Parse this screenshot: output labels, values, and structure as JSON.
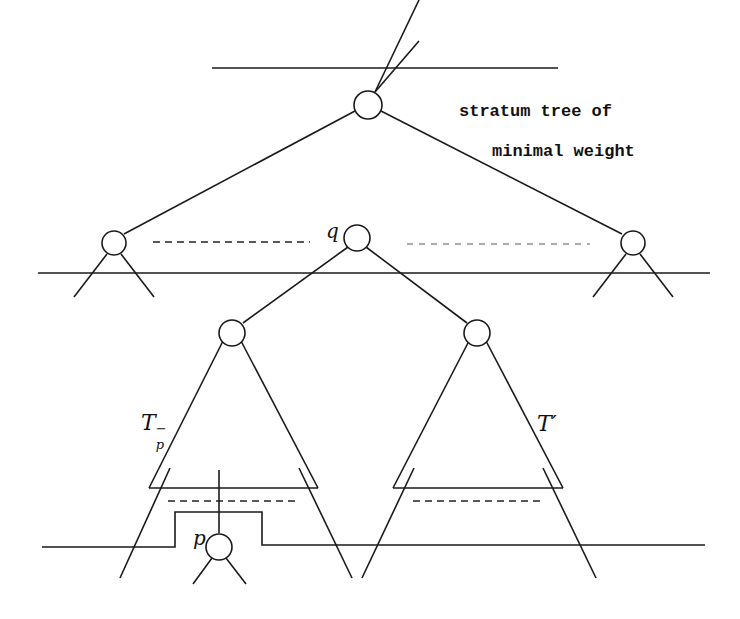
{
  "diagram": {
    "title_line1": "stratum tree of",
    "title_line2": "minimal weight",
    "labels": {
      "q": "q",
      "p": "p",
      "tp_base": "T",
      "tp_sub": "p",
      "tp_sup": "−",
      "tprime": "T′"
    },
    "nodes": [
      {
        "id": "root",
        "x": 368,
        "y": 105
      },
      {
        "id": "left",
        "x": 114,
        "y": 243
      },
      {
        "id": "q",
        "x": 357,
        "y": 238
      },
      {
        "id": "right",
        "x": 633,
        "y": 243
      },
      {
        "id": "q-left-child",
        "x": 232,
        "y": 333
      },
      {
        "id": "q-right-child",
        "x": 477,
        "y": 333
      },
      {
        "id": "p",
        "x": 219,
        "y": 547
      }
    ],
    "colors": {
      "stroke": "#1a1a1a",
      "background": "#ffffff",
      "light_dash": "#aaaaaa"
    }
  }
}
